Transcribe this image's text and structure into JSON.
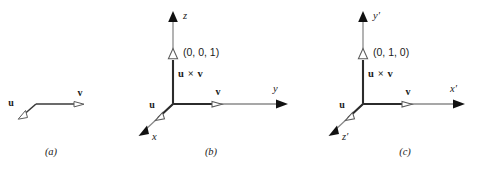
{
  "figure": {
    "width": 488,
    "height": 171,
    "background": "#ffffff",
    "stroke_color": "#3a3a3a",
    "axis_color": "#6e6e6e",
    "vector_color": "#2b2b2b",
    "text_color": "#1a1a1a"
  },
  "panels": [
    {
      "id": "a",
      "caption": "(a)",
      "labels": {
        "u": "u",
        "v": "v"
      },
      "description": "two vectors u and v joined tail to tail forming a bent path"
    },
    {
      "id": "b",
      "caption": "(b)",
      "labels": {
        "u": "u",
        "v": "v",
        "cross": "u × v",
        "coordinate": "(0, 0, 1)",
        "axis_up": "z",
        "axis_right": "y",
        "axis_front": "x"
      }
    },
    {
      "id": "c",
      "caption": "(c)",
      "labels": {
        "u": "u",
        "v": "v",
        "cross": "u × v",
        "coordinate": "(0, 1, 0)",
        "axis_up": "y′",
        "axis_right": "x′",
        "axis_front": "z′"
      }
    }
  ]
}
